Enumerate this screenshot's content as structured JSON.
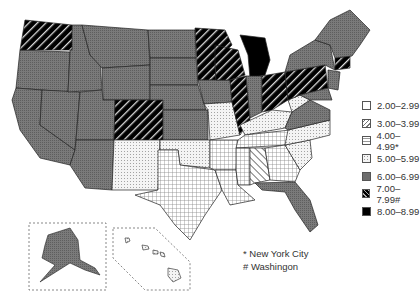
{
  "map": {
    "type": "choropleth",
    "region": "United States",
    "legend": [
      {
        "label": "2.00–2.99",
        "pattern": "white"
      },
      {
        "label": "3.00–3.99",
        "pattern": "diagonal-light"
      },
      {
        "label": "4.00–4.99*",
        "pattern": "crosshatch"
      },
      {
        "label": "5.00–5.99",
        "pattern": "dotted"
      },
      {
        "label": "6.00–6.99",
        "pattern": "gray"
      },
      {
        "label": "7.00–7.99#",
        "pattern": "dark-hatch"
      },
      {
        "label": "8.00–8.99",
        "pattern": "black"
      }
    ],
    "notes": [
      "* New York City",
      "# Washingon"
    ],
    "colors": {
      "gray": "#6e6e6e",
      "black": "#000000",
      "dotted_bg": "#f2f2f2",
      "border": "#222222"
    }
  }
}
